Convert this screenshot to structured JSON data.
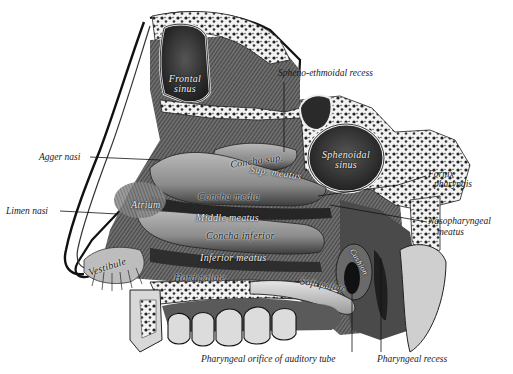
{
  "figure": {
    "colors": {
      "background": "#ffffff",
      "ink": "#1a1a1a",
      "shade_dark": "#3a3a3a",
      "shade_mid": "#7a7a7a",
      "shade_light": "#c8c8c8",
      "bone_light": "#ececec"
    }
  },
  "labels": {
    "external": {
      "spheno_ethmoidal_recess": "Spheno-ethmoidal recess",
      "agger_nasi": "Agger nasi",
      "limen_nasi": "Limen nasi",
      "fornix_line1": "Fornix",
      "fornix_line2": "pharyngis",
      "nasopharyngeal_line1": "Nasopharyngeal",
      "nasopharyngeal_line2": "meatus",
      "pharyngeal_orifice": "Pharyngeal orifice of auditory tube",
      "pharyngeal_recess": "Pharyngeal recess"
    },
    "internal": {
      "frontal_line1": "Frontal",
      "frontal_line2": "sinus",
      "sphenoidal_line1": "Sphenoidal",
      "sphenoidal_line2": "sinus",
      "concha_sup": "Concha sup.",
      "sup_meatus": "Sup. meatus",
      "concha_media": "Concha media",
      "atrium": "Atrium",
      "middle_meatus": "Middle meatus",
      "concha_inferior": "Concha inferior",
      "inferior_meatus": "Inferior meatus",
      "vestibule": "Vestibule",
      "hard_palate": "Hard palate",
      "soft_palate": "Soft palate",
      "cushion": "Cushion"
    }
  }
}
